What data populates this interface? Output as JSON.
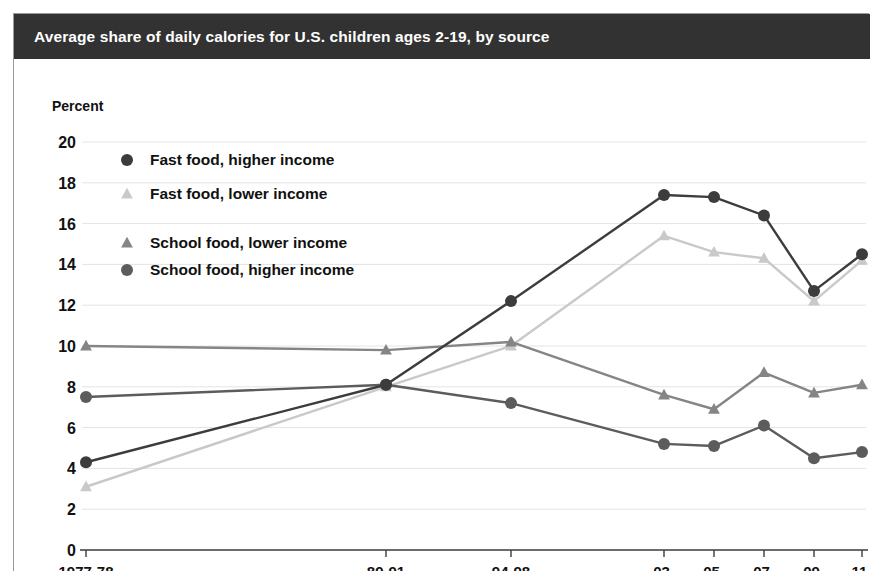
{
  "header": {
    "title": "Average share of daily calories for U.S. children ages 2-19, by source"
  },
  "colors": {
    "fast_food_higher": "#3c3c3c",
    "fast_food_lower": "#c9c9c9",
    "school_food_lower": "#858585",
    "school_food_higher": "#5c5c5c",
    "header_bg": "#323232",
    "header_text": "#ffffff",
    "grid": "#e4e4e4",
    "axis": "#3b3b3b",
    "border": "#9a9a9a",
    "background": "#ffffff"
  },
  "chart_data": {
    "type": "line",
    "title": "Average share of daily calories for U.S. children ages 2-19, by source",
    "xlabel": "",
    "ylabel": "Percent",
    "ylim": [
      0,
      20
    ],
    "yticks": [
      0,
      2,
      4,
      6,
      8,
      10,
      12,
      14,
      16,
      18,
      20
    ],
    "grid": true,
    "legend_position": "upper-left-inside",
    "categories": [
      "1977-78",
      "89-91",
      "94-98",
      "03-04",
      "05-06",
      "07-08",
      "09-10",
      "11-12"
    ],
    "category_lines": [
      [
        "1977-78"
      ],
      [
        "89-91"
      ],
      [
        "94-98"
      ],
      [
        "03-",
        "04"
      ],
      [
        "05-",
        "06"
      ],
      [
        "07-",
        "08"
      ],
      [
        "09-",
        "10"
      ],
      [
        "11-",
        "12"
      ]
    ],
    "x_positions": [
      72,
      372,
      497,
      650,
      700,
      750,
      800,
      848
    ],
    "series": [
      {
        "name": "Fast food, higher income",
        "marker": "circle",
        "color": "#3c3c3c",
        "values": [
          4.3,
          8.1,
          12.2,
          17.4,
          17.3,
          16.4,
          12.7,
          14.5
        ]
      },
      {
        "name": "Fast food, lower income",
        "marker": "triangle",
        "color": "#c9c9c9",
        "values": [
          3.1,
          8.0,
          10.0,
          15.4,
          14.6,
          14.3,
          12.2,
          14.2
        ]
      },
      {
        "name": "School food, lower income",
        "marker": "triangle",
        "color": "#858585",
        "values": [
          10.0,
          9.8,
          10.2,
          7.6,
          6.9,
          8.7,
          7.7,
          8.1
        ]
      },
      {
        "name": "School food, higher income",
        "marker": "circle",
        "color": "#5c5c5c",
        "values": [
          7.5,
          8.1,
          7.2,
          5.2,
          5.1,
          6.1,
          4.5,
          4.8
        ]
      }
    ],
    "legend_order": [
      "Fast food, higher income",
      "Fast food, lower income",
      "School food, lower income",
      "School food, higher income"
    ]
  }
}
